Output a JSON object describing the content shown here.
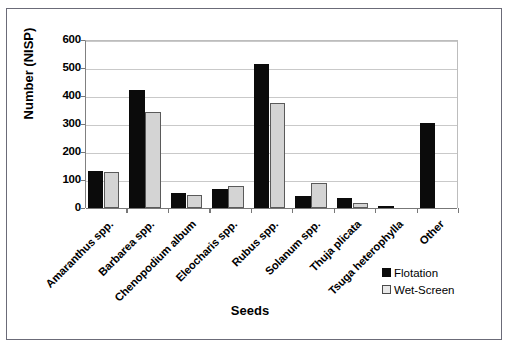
{
  "chart_data": {
    "type": "bar",
    "title": "",
    "xlabel": "Seeds",
    "ylabel": "Number (NISP)",
    "ylim": [
      0,
      600
    ],
    "ytick_labels": [
      "600",
      "500",
      "400",
      "300",
      "200",
      "100",
      "0"
    ],
    "ytick_values": [
      600,
      500,
      400,
      300,
      200,
      100,
      0
    ],
    "grid": true,
    "legend_position": "bottom-right",
    "categories": [
      "Amaranthus spp.",
      "Barbarea spp.",
      "Chenopodium album",
      "Eleocharis spp.",
      "Rubus spp.",
      "Solanum spp.",
      "Thuja plicata",
      "Tsuga heterophylla",
      "Other"
    ],
    "series": [
      {
        "name": "Flotation",
        "color": "#0b0b0b",
        "values": [
          133,
          420,
          55,
          68,
          516,
          44,
          37,
          6,
          303
        ]
      },
      {
        "name": "Wet-Screen",
        "color": "#d4d4d4",
        "values": [
          129,
          342,
          48,
          79,
          375,
          88,
          17,
          0,
          0
        ]
      }
    ]
  },
  "legend": {
    "entries": [
      {
        "label": "Flotation",
        "swatch": "black-square-icon"
      },
      {
        "label": "Wet-Screen",
        "swatch": "white-square-icon"
      }
    ]
  }
}
